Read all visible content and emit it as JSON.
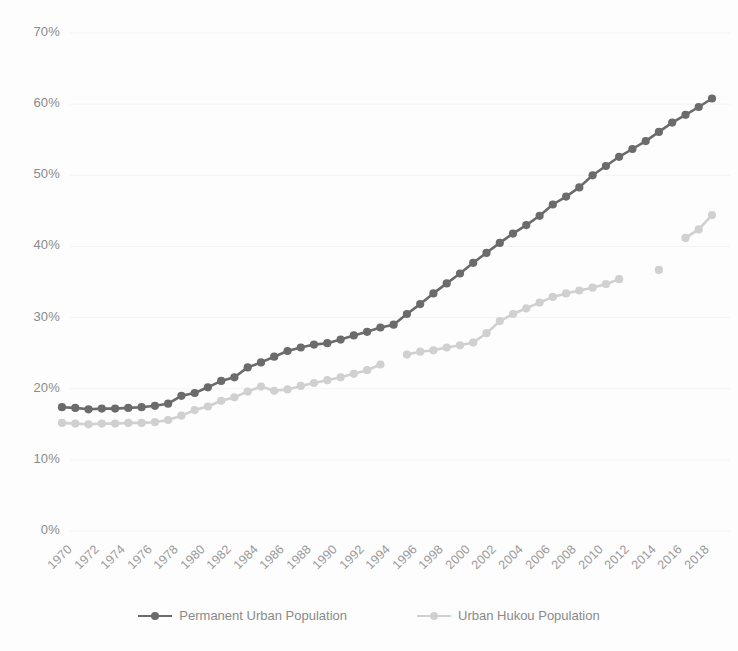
{
  "chart_data": {
    "type": "line",
    "title": "",
    "subtitle": "",
    "xlabel": "",
    "ylabel": "",
    "xlim": [
      1970,
      2019
    ],
    "ylim": [
      0,
      70
    ],
    "y_tick_labels": [
      "0%",
      "10%",
      "20%",
      "30%",
      "40%",
      "50%",
      "60%",
      "70%"
    ],
    "y_ticks": [
      0,
      10,
      20,
      30,
      40,
      50,
      60,
      70
    ],
    "x_tick_labels": [
      "1970",
      "1972",
      "1974",
      "1976",
      "1978",
      "1980",
      "1982",
      "1984",
      "1986",
      "1988",
      "1990",
      "1992",
      "1994",
      "1996",
      "1998",
      "2000",
      "2002",
      "2004",
      "2006",
      "2008",
      "2010",
      "2012",
      "2014",
      "2016",
      "2018"
    ],
    "x_ticks": [
      1970,
      1972,
      1974,
      1976,
      1978,
      1980,
      1982,
      1984,
      1986,
      1988,
      1990,
      1992,
      1994,
      1996,
      1998,
      2000,
      2002,
      2004,
      2006,
      2008,
      2010,
      2012,
      2014,
      2016,
      2018
    ],
    "grid": "horizontal",
    "legend_position": "bottom",
    "markers": "circle",
    "series": [
      {
        "name": "Permanent Urban Population",
        "color": "#6b6b6b",
        "x": [
          1970,
          1971,
          1972,
          1973,
          1974,
          1975,
          1976,
          1977,
          1978,
          1979,
          1980,
          1981,
          1982,
          1983,
          1984,
          1985,
          1986,
          1987,
          1988,
          1989,
          1990,
          1991,
          1992,
          1993,
          1994,
          1995,
          1996,
          1997,
          1998,
          1999,
          2000,
          2001,
          2002,
          2003,
          2004,
          2005,
          2006,
          2007,
          2008,
          2009,
          2010,
          2011,
          2012,
          2013,
          2014,
          2015,
          2016,
          2017,
          2018,
          2019
        ],
        "values": [
          17.4,
          17.3,
          17.1,
          17.2,
          17.2,
          17.3,
          17.4,
          17.6,
          17.9,
          19.0,
          19.4,
          20.2,
          21.1,
          21.6,
          23.0,
          23.7,
          24.5,
          25.3,
          25.8,
          26.2,
          26.4,
          26.9,
          27.5,
          28.0,
          28.6,
          29.0,
          30.5,
          31.9,
          33.4,
          34.8,
          36.2,
          37.7,
          39.1,
          40.5,
          41.8,
          43.0,
          44.3,
          45.9,
          47.0,
          48.3,
          50.0,
          51.3,
          52.6,
          53.7,
          54.8,
          56.1,
          57.4,
          58.5,
          59.6,
          60.8
        ]
      },
      {
        "name": "Urban Hukou Population",
        "color": "#d0d0d0",
        "x": [
          1970,
          1971,
          1972,
          1973,
          1974,
          1975,
          1976,
          1977,
          1978,
          1979,
          1980,
          1981,
          1982,
          1983,
          1984,
          1985,
          1986,
          1987,
          1988,
          1989,
          1990,
          1991,
          1992,
          1993,
          1994,
          1996,
          1997,
          1998,
          1999,
          2000,
          2001,
          2002,
          2003,
          2004,
          2005,
          2006,
          2007,
          2008,
          2009,
          2010,
          2011,
          2012,
          2015,
          2017,
          2018,
          2019
        ],
        "values": [
          15.2,
          15.1,
          15.0,
          15.1,
          15.1,
          15.2,
          15.2,
          15.3,
          15.6,
          16.2,
          17.0,
          17.5,
          18.3,
          18.8,
          19.6,
          20.3,
          19.7,
          19.9,
          20.4,
          20.8,
          21.2,
          21.6,
          22.1,
          22.6,
          23.4,
          24.8,
          25.2,
          25.4,
          25.8,
          26.1,
          26.5,
          27.8,
          29.5,
          30.5,
          31.3,
          32.1,
          32.9,
          33.4,
          33.8,
          34.2,
          34.7,
          35.4,
          36.7,
          41.2,
          42.4,
          44.4
        ]
      }
    ]
  }
}
